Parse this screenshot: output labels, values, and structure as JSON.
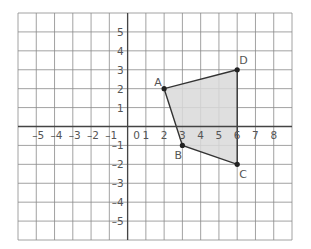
{
  "diagram": {
    "type": "coordinate-plane-polygon",
    "grid": {
      "x_range": [
        -6,
        9
      ],
      "y_range": [
        -6,
        6
      ],
      "step": 1,
      "line_color": "#8a8a8a",
      "axis_color": "#444444"
    },
    "x_tick_labels": [
      "-5",
      "-4",
      "-3",
      "-2",
      "-1",
      "0",
      "1",
      "2",
      "3",
      "4",
      "5",
      "6",
      "7",
      "8"
    ],
    "y_tick_labels": [
      "5",
      "4",
      "3",
      "2",
      "1",
      "-1",
      "-2",
      "-3",
      "-4",
      "-5"
    ],
    "origin_label": "0",
    "polygon": {
      "fill": "#d9d9d9",
      "stroke": "#333333",
      "vertices": [
        {
          "label": "A",
          "x": 2,
          "y": 2
        },
        {
          "label": "B",
          "x": 3,
          "y": -1
        },
        {
          "label": "C",
          "x": 6,
          "y": -2
        },
        {
          "label": "D",
          "x": 6,
          "y": 3
        }
      ]
    }
  }
}
